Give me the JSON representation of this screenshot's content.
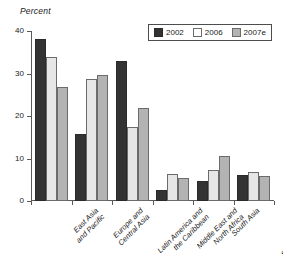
{
  "chart_data": {
    "type": "bar",
    "title": "",
    "ylabel": "Percent",
    "xlabel": "",
    "ylim": [
      0,
      40
    ],
    "yticks": [
      0,
      10,
      20,
      30,
      40
    ],
    "grid": false,
    "legend_position": "top-right",
    "categories": [
      "East Asia\nand Pacific",
      "Europe and\nCentral Asia",
      "Latin America and\nthe Caribbean",
      "Middle East and\nNorth Africa",
      "South Asia",
      "Sub-Saharan Africa"
    ],
    "series": [
      {
        "name": "2002",
        "color": "#333333",
        "values": [
          38.2,
          15.8,
          33.0,
          2.6,
          4.7,
          6.2
        ]
      },
      {
        "name": "2006",
        "color": "#e6e6e6",
        "values": [
          34.0,
          28.8,
          17.3,
          6.3,
          7.2,
          6.9
        ]
      },
      {
        "name": "2007e",
        "color": "#b3b3b3",
        "values": [
          26.9,
          29.7,
          22.0,
          5.3,
          10.5,
          6.0
        ]
      }
    ]
  },
  "legend": {
    "items": [
      {
        "label": "2002",
        "swatch": "legend-swatch-2002"
      },
      {
        "label": "2006",
        "swatch": "legend-swatch-2006"
      },
      {
        "label": "2007e",
        "swatch": "legend-swatch-2007e"
      }
    ]
  },
  "axis": {
    "y_title": "Percent",
    "y_tick_labels": [
      "40",
      "30",
      "20",
      "10",
      "0"
    ]
  },
  "category_labels": [
    {
      "line1": "East Asia",
      "line2": "and Pacific"
    },
    {
      "line1": "Europe and",
      "line2": "Central Asia"
    },
    {
      "line1": "Latin America and",
      "line2": "the Caribbean"
    },
    {
      "line1": "Middle East and",
      "line2": "North Africa"
    },
    {
      "line1": "South Asia",
      "line2": ""
    },
    {
      "line1": "Sub-Saharan Africa",
      "line2": ""
    }
  ]
}
